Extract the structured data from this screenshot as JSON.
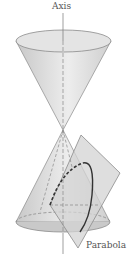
{
  "diagram": {
    "labels": {
      "axis": "Axis",
      "parabola": "Parabola"
    },
    "colors": {
      "cone_fill": "#d9d9d9",
      "cone_stroke": "#8a8a8a",
      "plane_fill": "#cfcfcf",
      "curve": "#333333",
      "text": "#555555"
    }
  }
}
